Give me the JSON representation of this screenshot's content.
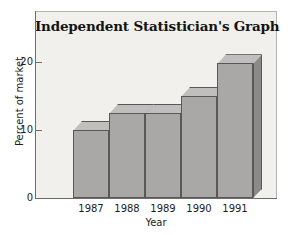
{
  "chart_data": {
    "type": "bar",
    "title": "Independent Statistician's Graph",
    "xlabel": "Year",
    "ylabel": "Percent of market",
    "categories": [
      "1987",
      "1988",
      "1989",
      "1990",
      "1991"
    ],
    "values": [
      10,
      12.5,
      12.5,
      15,
      19.8
    ],
    "ytick_labels": [
      "0",
      "10",
      "20"
    ],
    "ytick_values": [
      0,
      10,
      20
    ],
    "ylim": [
      0,
      27.5
    ],
    "grid": false,
    "legend": null,
    "style": {
      "bar_front_color": "#a9a8a6",
      "bar_top_color": "#c0bfbd",
      "bar_side_color": "#8b8a89",
      "bar_edge_color": "#58585a",
      "plot_background": "#f1f0ed",
      "axis_color": "#6e6c6a",
      "text_color": "#1c1c1c"
    }
  }
}
